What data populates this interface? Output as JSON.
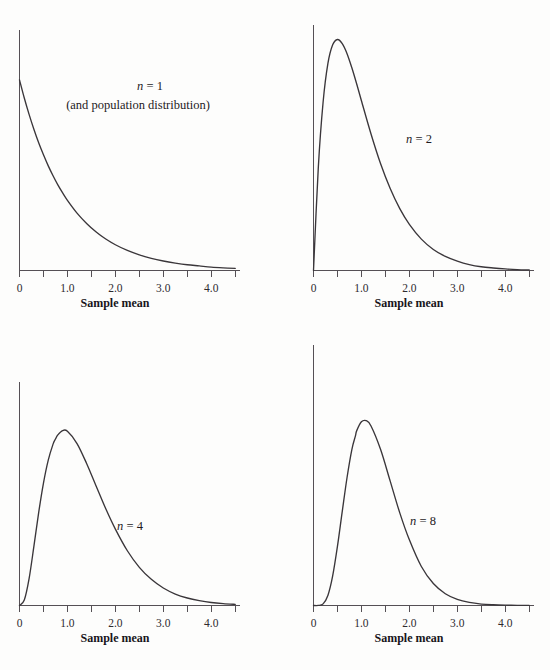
{
  "figure": {
    "background_color": "#fdfdfc",
    "curve_color": "#3a363a",
    "axis_color": "#555055",
    "text_color": "#1d1a1d"
  },
  "chart_data": [
    {
      "type": "line",
      "title": "",
      "panel_label": "n = 1",
      "panel_sublabel": "(and population distribution)",
      "n": 1,
      "distribution": "gamma (sampling distribution of the mean, exponential population, mean 1)",
      "xlabel": "Sample mean",
      "ylabel": "",
      "xlim": [
        0,
        4.6
      ],
      "ylim": [
        0,
        1.12
      ],
      "grid": false,
      "legend": "none",
      "xticks": [
        0,
        0.5,
        1.0,
        1.5,
        2.0,
        2.5,
        3.0,
        3.5,
        4.0,
        4.5
      ],
      "xticklabels": [
        "0",
        "",
        "1.0",
        "",
        "2.0",
        "",
        "3.0",
        "",
        "4.0",
        ""
      ],
      "x": [
        0,
        0.1,
        0.2,
        0.3,
        0.4,
        0.5,
        0.6,
        0.7,
        0.8,
        0.9,
        1.0,
        1.2,
        1.4,
        1.6,
        1.8,
        2.0,
        2.25,
        2.5,
        2.75,
        3.0,
        3.25,
        3.5,
        3.75,
        4.0,
        4.25,
        4.5
      ],
      "y": [
        1.0,
        0.905,
        0.819,
        0.741,
        0.67,
        0.607,
        0.549,
        0.497,
        0.449,
        0.407,
        0.368,
        0.301,
        0.247,
        0.202,
        0.165,
        0.135,
        0.105,
        0.082,
        0.064,
        0.05,
        0.039,
        0.03,
        0.024,
        0.018,
        0.014,
        0.011
      ]
    },
    {
      "type": "line",
      "title": "",
      "panel_label": "n = 2",
      "panel_sublabel": "",
      "n": 2,
      "distribution": "gamma (sampling distribution of the mean, exponential population, mean 1)",
      "xlabel": "Sample mean",
      "ylabel": "",
      "xlim": [
        0,
        4.6
      ],
      "ylim": [
        0,
        0.76
      ],
      "grid": false,
      "legend": "none",
      "xticks": [
        0,
        0.5,
        1.0,
        1.5,
        2.0,
        2.5,
        3.0,
        3.5,
        4.0,
        4.5
      ],
      "xticklabels": [
        "0",
        "",
        "1.0",
        "",
        "2.0",
        "",
        "3.0",
        "",
        "4.0",
        ""
      ],
      "x": [
        0,
        0.1,
        0.2,
        0.3,
        0.4,
        0.5,
        0.6,
        0.7,
        0.8,
        0.9,
        1.0,
        1.2,
        1.4,
        1.6,
        1.8,
        2.0,
        2.25,
        2.5,
        2.75,
        3.0,
        3.25,
        3.5,
        3.75,
        4.0,
        4.25,
        4.5
      ],
      "y": [
        0.0,
        0.327,
        0.536,
        0.659,
        0.719,
        0.736,
        0.723,
        0.691,
        0.646,
        0.595,
        0.541,
        0.435,
        0.34,
        0.261,
        0.197,
        0.147,
        0.1,
        0.067,
        0.045,
        0.03,
        0.019,
        0.012,
        0.008,
        0.005,
        0.003,
        0.002
      ]
    },
    {
      "type": "line",
      "title": "",
      "panel_label": "n = 4",
      "panel_sublabel": "",
      "n": 4,
      "distribution": "gamma (sampling distribution of the mean, exponential population, mean 1)",
      "xlabel": "Sample mean",
      "ylabel": "",
      "xlim": [
        0,
        4.6
      ],
      "ylim": [
        0,
        1.05
      ],
      "grid": false,
      "legend": "none",
      "xticks": [
        0,
        0.5,
        1.0,
        1.5,
        2.0,
        2.5,
        3.0,
        3.5,
        4.0,
        4.5
      ],
      "xticklabels": [
        "0",
        "",
        "1.0",
        "",
        "2.0",
        "",
        "3.0",
        "",
        "4.0",
        ""
      ],
      "x": [
        0,
        0.1,
        0.2,
        0.3,
        0.4,
        0.5,
        0.6,
        0.7,
        0.75,
        0.8,
        0.9,
        1.0,
        1.2,
        1.4,
        1.6,
        1.8,
        2.0,
        2.25,
        2.5,
        2.75,
        3.0,
        3.25,
        3.5,
        3.75,
        4.0,
        4.25,
        4.5
      ],
      "y": [
        0.0,
        0.029,
        0.143,
        0.314,
        0.494,
        0.651,
        0.773,
        0.858,
        0.885,
        0.907,
        0.93,
        0.926,
        0.861,
        0.755,
        0.634,
        0.514,
        0.406,
        0.291,
        0.203,
        0.139,
        0.093,
        0.061,
        0.04,
        0.026,
        0.016,
        0.01,
        0.006
      ]
    },
    {
      "type": "line",
      "title": "",
      "panel_label": "n = 8",
      "panel_sublabel": "",
      "n": 8,
      "distribution": "gamma (sampling distribution of the mean, exponential population, mean 1)",
      "xlabel": "Sample mean",
      "ylabel": "",
      "xlim": [
        0,
        4.6
      ],
      "ylim": [
        0,
        1.42
      ],
      "grid": false,
      "legend": "none",
      "xticks": [
        0,
        0.5,
        1.0,
        1.5,
        2.0,
        2.5,
        3.0,
        3.5,
        4.0,
        4.5
      ],
      "xticklabels": [
        "0",
        "",
        "1.0",
        "",
        "2.0",
        "",
        "3.0",
        "",
        "4.0",
        ""
      ],
      "x": [
        0,
        0.1,
        0.2,
        0.3,
        0.4,
        0.5,
        0.6,
        0.7,
        0.8,
        0.875,
        0.9,
        1.0,
        1.1,
        1.2,
        1.4,
        1.6,
        1.8,
        2.0,
        2.25,
        2.5,
        2.75,
        3.0,
        3.25,
        3.5,
        3.75,
        4.0,
        4.25,
        4.5
      ],
      "y": [
        0.0,
        0.0002,
        0.009,
        0.055,
        0.163,
        0.327,
        0.519,
        0.706,
        0.86,
        0.935,
        0.963,
        1.013,
        1.019,
        0.99,
        0.86,
        0.686,
        0.511,
        0.362,
        0.215,
        0.121,
        0.065,
        0.034,
        0.017,
        0.008,
        0.004,
        0.002,
        0.001,
        0.0004
      ]
    }
  ],
  "panels": [
    {
      "id": "panel-0",
      "label_main": "n",
      "label_eq": " = 1",
      "sublabel": "(and population distribution)",
      "xlabel": "Sample mean",
      "ticklabels": [
        "0",
        "1.0",
        "2.0",
        "3.0",
        "4.0"
      ]
    },
    {
      "id": "panel-1",
      "label_main": "n",
      "label_eq": " = 2",
      "sublabel": "",
      "xlabel": "Sample mean",
      "ticklabels": [
        "0",
        "1.0",
        "2.0",
        "3.0",
        "4.0"
      ]
    },
    {
      "id": "panel-2",
      "label_main": "n",
      "label_eq": " = 4",
      "sublabel": "",
      "xlabel": "Sample mean",
      "ticklabels": [
        "0",
        "1.0",
        "2.0",
        "3.0",
        "4.0"
      ]
    },
    {
      "id": "panel-3",
      "label_main": "n",
      "label_eq": " = 8",
      "sublabel": "",
      "xlabel": "Sample mean",
      "ticklabels": [
        "0",
        "1.0",
        "2.0",
        "3.0",
        "4.0"
      ]
    }
  ]
}
